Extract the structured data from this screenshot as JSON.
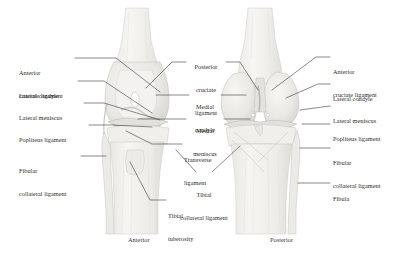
{
  "figure": {
    "background": "#ffffff",
    "text_color": "#2b2b2b",
    "leader_color": "#4a4a4a",
    "bone_fill": "#f2f1ef",
    "bone_stroke": "#c9c7c3",
    "cartilage_fill": "#e6e5e2",
    "shadow_fill": "#dddbd7"
  },
  "captions": [
    {
      "name": "anterior-view-caption",
      "text": "Anterior"
    },
    {
      "name": "posterior-view-caption",
      "text": "Posterior"
    }
  ],
  "labels": {
    "left": [
      {
        "id": "anterior-cruciate-ligament-left",
        "line1": "Anterior",
        "line2": "cruciate ligament"
      },
      {
        "id": "lateral-condyle-left",
        "line1": "Lateral condyle",
        "line2": ""
      },
      {
        "id": "lateral-meniscus-left",
        "line1": "Lateral meniscus",
        "line2": ""
      },
      {
        "id": "popliteus-ligament-left",
        "line1": "Popliteus ligament",
        "line2": ""
      },
      {
        "id": "fibular-collateral-ligament-left",
        "line1": "Fibular",
        "line2": "collateral ligament"
      }
    ],
    "center": [
      {
        "id": "posterior-cruciate-ligament",
        "line1": "Posterior",
        "line2": "cruciate",
        "line3": "ligament"
      },
      {
        "id": "medial-condyle",
        "line1": "Medial",
        "line2": "condyle",
        "line3": ""
      },
      {
        "id": "medial-meniscus",
        "line1": "Medial",
        "line2": "meniscus",
        "line3": ""
      },
      {
        "id": "transverse-ligament",
        "line1": "Transverse",
        "line2": "ligament",
        "line3": ""
      },
      {
        "id": "tibial-collateral-ligament",
        "line1": "Tibial",
        "line2": "collateral ligament",
        "line3": ""
      },
      {
        "id": "tibial-tuberosity",
        "line1": "Tibial",
        "line2": "tuberosity",
        "line3": ""
      }
    ],
    "right": [
      {
        "id": "anterior-cruciate-ligament-right",
        "line1": "Anterior",
        "line2": "cruciate ligament"
      },
      {
        "id": "lateral-condyle-right",
        "line1": "Lateral condyle",
        "line2": ""
      },
      {
        "id": "lateral-meniscus-right",
        "line1": "Lateral meniscus",
        "line2": ""
      },
      {
        "id": "popliteus-ligament-right",
        "line1": "Popliteus ligament",
        "line2": ""
      },
      {
        "id": "fibular-collateral-ligament-right",
        "line1": "Fibular",
        "line2": "collateral ligament"
      },
      {
        "id": "fibula-right",
        "line1": "Fibula",
        "line2": ""
      }
    ]
  }
}
